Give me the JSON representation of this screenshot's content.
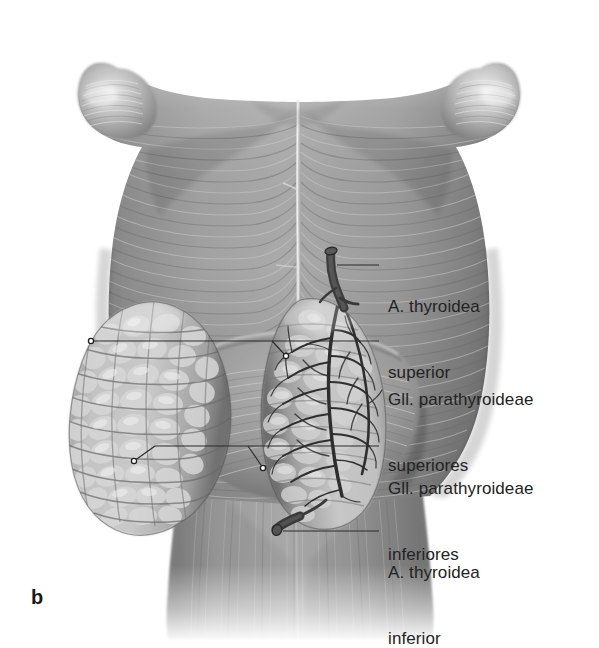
{
  "figure": {
    "letter": "b",
    "view": "posterior-view-pharynx-thyroid",
    "background_color": "#ffffff",
    "ink_color": "#232323",
    "leader_color": "#2b2b2b"
  },
  "labels": [
    {
      "id": "a-thyroidea-superior",
      "name": "label-a-thyroidea-superior",
      "line1": "A. thyroidea",
      "line2": "superior",
      "text_x": 388,
      "text_y": 252,
      "leader": {
        "x1": 337,
        "y1": 265,
        "x2": 379,
        "y2": 265
      },
      "dots": [
        {
          "x": 337,
          "y": 265
        }
      ]
    },
    {
      "id": "gll-parathyroideae-superiores",
      "name": "label-gll-parathyroideae-superiores",
      "line1": "Gll. parathyroideae",
      "line2": "superiores",
      "text_x": 388,
      "text_y": 345,
      "leader": {
        "x1": 91,
        "y1": 341,
        "x2": 379,
        "y2": 341
      },
      "dots": [
        {
          "x": 91,
          "y": 341
        },
        {
          "x": 285,
          "y": 355
        }
      ],
      "branch": {
        "x1": 272,
        "y1": 341,
        "x2": 285,
        "y2": 355
      }
    },
    {
      "id": "gll-parathyroideae-inferiores",
      "name": "label-gll-parathyroideae-inferiores",
      "line1": "Gll. parathyroideae",
      "line2": "inferiores",
      "text_x": 388,
      "text_y": 434,
      "leader": {
        "x1": 155,
        "y1": 446,
        "x2": 379,
        "y2": 446
      },
      "dots": [
        {
          "x": 133,
          "y": 461
        },
        {
          "x": 262,
          "y": 468
        }
      ],
      "branch": {
        "x1": 155,
        "y1": 446,
        "x2": 133,
        "y2": 461
      },
      "branch2": {
        "x1": 248,
        "y1": 446,
        "x2": 262,
        "y2": 468
      }
    },
    {
      "id": "a-thyroidea-inferior",
      "name": "label-a-thyroidea-inferior",
      "line1": "A. thyroidea",
      "line2": "inferior",
      "text_x": 388,
      "text_y": 518,
      "leader": {
        "x1": 281,
        "y1": 531,
        "x2": 379,
        "y2": 531
      },
      "dots": [
        {
          "x": 281,
          "y": 531
        }
      ]
    }
  ],
  "anatomy": {
    "pharynx_fill": "#8f8f8f",
    "pharynx_shadow": "#5d5d5d",
    "pharynx_light": "#b9b9b9",
    "raphe_color": "#d8d8d8",
    "thyroid_fill": "#a9a9a9",
    "thyroid_lobule": "#cfcfcf",
    "artery_color": "#3a3a3a",
    "esophagus_fill": "#8a8a8a"
  }
}
